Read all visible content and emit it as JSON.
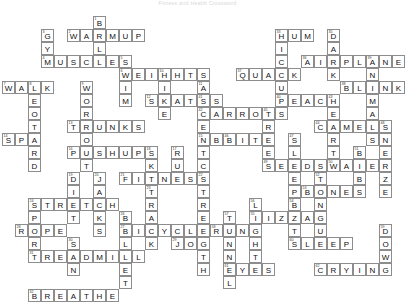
{
  "header": {
    "title": "Fitness and Health Crossword"
  },
  "puzzle": {
    "name": "crossword-grid",
    "cell_size": 13,
    "cols": 30,
    "rows": 20,
    "origin_x": 2,
    "origin_y": 16,
    "colors": {
      "cell_border": "#8d8d8d",
      "cell_fill": "#ffffff",
      "letter": "#111111",
      "number": "#333333",
      "title": "#d8d8d8"
    },
    "entries": [
      {
        "num": "1",
        "answer": "BALL",
        "dir": "down",
        "col": 7,
        "row": 0
      },
      {
        "num": "2",
        "answer": "WARMUP",
        "dir": "across",
        "col": 5,
        "row": 1
      },
      {
        "num": "3",
        "answer": "GYM",
        "dir": "down",
        "col": 3,
        "row": 1
      },
      {
        "num": "4",
        "answer": "MUSCLES",
        "dir": "across",
        "col": 3,
        "row": 3
      },
      {
        "num": "5",
        "answer": "SWIM",
        "dir": "down",
        "col": 9,
        "row": 3
      },
      {
        "num": "6",
        "answer": "WEIGHTS",
        "dir": "across",
        "col": 9,
        "row": 4
      },
      {
        "num": "7",
        "answer": "WALK",
        "dir": "across",
        "col": 0,
        "row": 5
      },
      {
        "num": "8",
        "answer": "LEOTARD",
        "dir": "down",
        "col": 2,
        "row": 5
      },
      {
        "num": "9",
        "answer": "WORKOUT",
        "dir": "down",
        "col": 6,
        "row": 5
      },
      {
        "num": "10",
        "answer": "HIKE",
        "dir": "down",
        "col": 12,
        "row": 4
      },
      {
        "num": "11",
        "answer": "AEROBICS",
        "dir": "down",
        "col": 15,
        "row": 5
      },
      {
        "num": "12",
        "answer": "SKATES",
        "dir": "across",
        "col": 11,
        "row": 6
      },
      {
        "num": "13",
        "answer": "TRUNKS",
        "dir": "across",
        "col": 5,
        "row": 8
      },
      {
        "num": "14",
        "answer": "SPA",
        "dir": "across",
        "col": 0,
        "row": 9
      },
      {
        "num": "15",
        "answer": "ABS",
        "dir": "across",
        "col": 15,
        "row": 9
      },
      {
        "num": "16",
        "answer": "PUSHUPS",
        "dir": "across",
        "col": 5,
        "row": 10
      },
      {
        "num": "17",
        "answer": "RUN",
        "dir": "down",
        "col": 13,
        "row": 10
      },
      {
        "num": "18",
        "answer": "SKI",
        "dir": "down",
        "col": 11,
        "row": 10
      },
      {
        "num": "19",
        "answer": "DIET",
        "dir": "down",
        "col": 5,
        "row": 12
      },
      {
        "num": "20",
        "answer": "JACKS",
        "dir": "down",
        "col": 7,
        "row": 12
      },
      {
        "num": "21",
        "answer": "FITNESS",
        "dir": "across",
        "col": 9,
        "row": 12
      },
      {
        "num": "22",
        "answer": "STRENGTH",
        "dir": "down",
        "col": 15,
        "row": 12
      },
      {
        "num": "23",
        "answer": "TRACK",
        "dir": "down",
        "col": 11,
        "row": 13
      },
      {
        "num": "24",
        "answer": "STRETCH",
        "dir": "across",
        "col": 2,
        "row": 14
      },
      {
        "num": "25",
        "answer": "SPORT",
        "dir": "down",
        "col": 2,
        "row": 14
      },
      {
        "num": "26",
        "answer": "BALLET",
        "dir": "down",
        "col": 9,
        "row": 15
      },
      {
        "num": "27",
        "answer": "BICYCLE",
        "dir": "across",
        "col": 9,
        "row": 16
      },
      {
        "num": "28",
        "answer": "ROPE",
        "dir": "across",
        "col": 1,
        "row": 16
      },
      {
        "num": "29",
        "answer": "JOG",
        "dir": "across",
        "col": 13,
        "row": 17
      },
      {
        "num": "30",
        "answer": "SUN",
        "dir": "down",
        "col": 5,
        "row": 17
      },
      {
        "num": "31",
        "answer": "TREADMILL",
        "dir": "across",
        "col": 2,
        "row": 18
      },
      {
        "num": "32",
        "answer": "BREATHE",
        "dir": "across",
        "col": 2,
        "row": 21
      },
      {
        "num": "33",
        "answer": "HUM",
        "dir": "across",
        "col": 21,
        "row": 1
      },
      {
        "num": "34",
        "answer": "HICCUP",
        "dir": "down",
        "col": 21,
        "row": 1
      },
      {
        "num": "35",
        "answer": "DARK",
        "dir": "down",
        "col": 25,
        "row": 1
      },
      {
        "num": "36",
        "answer": "AIRPLANE",
        "dir": "across",
        "col": 23,
        "row": 3
      },
      {
        "num": "37",
        "answer": "QUACK",
        "dir": "across",
        "col": 18,
        "row": 4
      },
      {
        "num": "38",
        "answer": "BLINK",
        "dir": "across",
        "col": 26,
        "row": 5
      },
      {
        "num": "39",
        "answer": "ANIMALS",
        "dir": "down",
        "col": 28,
        "row": 3
      },
      {
        "num": "40",
        "answer": "PEACH",
        "dir": "across",
        "col": 21,
        "row": 6
      },
      {
        "num": "41",
        "answer": "SCENT",
        "dir": "down",
        "col": 15,
        "row": 6
      },
      {
        "num": "42",
        "answer": "CARROTS",
        "dir": "across",
        "col": 15,
        "row": 7
      },
      {
        "num": "43",
        "answer": "HEART",
        "dir": "down",
        "col": 25,
        "row": 6
      },
      {
        "num": "44",
        "answer": "CAMELS",
        "dir": "across",
        "col": 24,
        "row": 8
      },
      {
        "num": "45",
        "answer": "TREES",
        "dir": "down",
        "col": 20,
        "row": 7
      },
      {
        "num": "46",
        "answer": "BITE",
        "dir": "across",
        "col": 17,
        "row": 9
      },
      {
        "num": "47",
        "answer": "SLEEP",
        "dir": "down",
        "col": 22,
        "row": 9
      },
      {
        "num": "48",
        "answer": "SNEEZE",
        "dir": "down",
        "col": 29,
        "row": 8
      },
      {
        "num": "49",
        "answer": "SEEDS",
        "dir": "across",
        "col": 20,
        "row": 11
      },
      {
        "num": "50",
        "answer": "WATER",
        "dir": "across",
        "col": 25,
        "row": 11
      },
      {
        "num": "51",
        "answer": "BIBS",
        "dir": "down",
        "col": 27,
        "row": 10
      },
      {
        "num": "52",
        "answer": "TONGUE",
        "dir": "down",
        "col": 24,
        "row": 12
      },
      {
        "num": "53",
        "answer": "BONES",
        "dir": "across",
        "col": 23,
        "row": 13
      },
      {
        "num": "54",
        "answer": "BAT",
        "dir": "down",
        "col": 22,
        "row": 14
      },
      {
        "num": "55",
        "answer": "PIZZA",
        "dir": "across",
        "col": 19,
        "row": 15
      },
      {
        "num": "56",
        "answer": "LIGHTS",
        "dir": "down",
        "col": 19,
        "row": 14
      },
      {
        "num": "57",
        "answer": "TUNNEL",
        "dir": "down",
        "col": 17,
        "row": 15
      },
      {
        "num": "58",
        "answer": "RUN",
        "dir": "across",
        "col": 16,
        "row": 16
      },
      {
        "num": "59",
        "answer": "DOWN",
        "dir": "down",
        "col": 29,
        "row": 16
      },
      {
        "num": "60",
        "answer": "SLEEP",
        "dir": "across",
        "col": 22,
        "row": 17
      },
      {
        "num": "61",
        "answer": "EYES",
        "dir": "across",
        "col": 17,
        "row": 19
      },
      {
        "num": "62",
        "answer": "CRYING",
        "dir": "across",
        "col": 24,
        "row": 19
      }
    ]
  }
}
